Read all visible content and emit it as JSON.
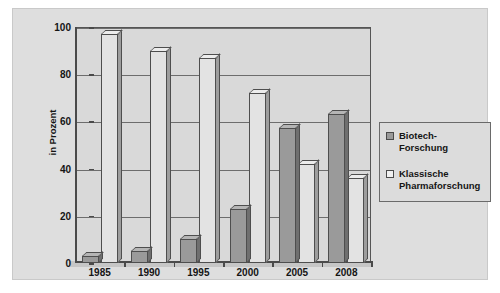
{
  "chart_data": {
    "type": "bar",
    "title": "",
    "subtitle": "",
    "xlabel": "",
    "ylabel": "in Prozent",
    "categories": [
      "1985",
      "1990",
      "1995",
      "2000",
      "2005",
      "2008"
    ],
    "series": [
      {
        "name": "Biotech-Forschung",
        "color": "#9a9a9a",
        "values": [
          3,
          5,
          10,
          23,
          57,
          63
        ]
      },
      {
        "name": "Klassische Pharmaforschung",
        "color": "#e3e3e3",
        "values": [
          97,
          90,
          87,
          72,
          42,
          36
        ]
      }
    ],
    "ylim": [
      0,
      100
    ],
    "yticks": [
      0,
      20,
      40,
      60,
      80,
      100
    ],
    "ytick_labels": [
      "0",
      "20",
      "40",
      "60",
      "80",
      "100"
    ],
    "grid": true,
    "grid_axis": "y",
    "legend_position": "right",
    "style": "3d-bar"
  },
  "legend": {
    "entries": [
      {
        "label": "Biotech-Forschung",
        "swatch": "dark-grey-swatch"
      },
      {
        "label": "Klassische Pharmaforschung",
        "swatch": "white-swatch"
      }
    ]
  },
  "axis": {
    "y_title": "in Prozent",
    "y_ticks": [
      "100",
      "80",
      "60",
      "40",
      "20",
      "0"
    ],
    "x_ticks": [
      "1985",
      "1990",
      "1995",
      "2000",
      "2005",
      "2008"
    ]
  }
}
